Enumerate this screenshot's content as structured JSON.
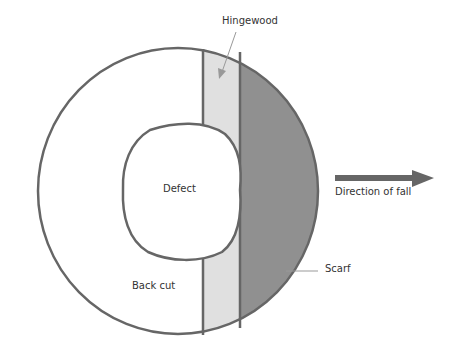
{
  "diagram": {
    "labels": {
      "hingewood": "Hingewood",
      "defect": "Defect",
      "direction": "Direction of fall",
      "scarf": "Scarf",
      "backcut": "Back cut"
    },
    "colors": {
      "outline": "#666666",
      "hingewood_fill": "#e0e0e0",
      "scarf_fill": "#909090",
      "arrow": "#666666",
      "background": "#ffffff",
      "text": "#333333"
    }
  }
}
